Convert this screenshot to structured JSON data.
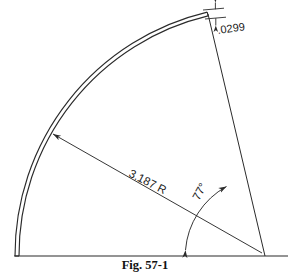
{
  "figure": {
    "caption": "Fig. 57-1",
    "caption_position": {
      "x": 145,
      "y": 268
    },
    "background_color": "#ffffff",
    "line_color": "#2b2b2b",
    "text_color": "#1a1a1a"
  },
  "dimensions": {
    "thickness": {
      "label": ".0299",
      "name": "thickness-dimension",
      "x": 218,
      "y": 34,
      "rotation": -8
    },
    "radius": {
      "label": "3.187 R",
      "name": "radius-dimension",
      "x": 128,
      "y": 176,
      "rotation": 27
    },
    "angle": {
      "label": "77°",
      "name": "angle-dimension",
      "x": 199,
      "y": 200,
      "rotation": -62
    }
  },
  "geometry": {
    "vertex": {
      "x": 265,
      "y": 256
    },
    "baseline": {
      "x1": 14,
      "y1": 256,
      "x2": 288,
      "y2": 256
    },
    "arc_radius_outer": 250,
    "arc_radius_inner": 246,
    "arc_start_angle_deg": 180,
    "arc_end_angle_deg": 257,
    "angle_value_deg": 77,
    "radius_value": "3.187",
    "thickness_value": ".0299"
  }
}
